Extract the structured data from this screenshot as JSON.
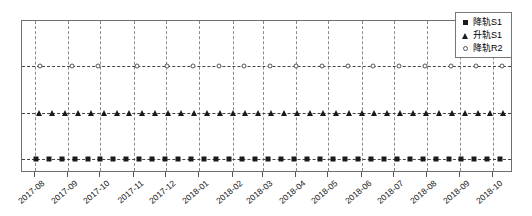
{
  "chart_data": {
    "type": "scatter",
    "title": "",
    "xlabel": "",
    "ylabel": "",
    "grid": true,
    "legend_position": "upper-right",
    "x_tick_labels": [
      "2017-08",
      "2017-09",
      "2017-10",
      "2017-11",
      "2017-12",
      "2018-01",
      "2018-02",
      "2018-03",
      "2018-04",
      "2018-05",
      "2018-06",
      "2018-07",
      "2018-08",
      "2018-09",
      "2018-10"
    ],
    "xlim": [
      "2017-07-20",
      "2018-10-20"
    ],
    "ylim": [
      0,
      3
    ],
    "series": [
      {
        "name": "降轨S1",
        "marker": "square",
        "level": 1,
        "x": [
          "2017-08-02",
          "2017-08-14",
          "2017-08-26",
          "2017-09-07",
          "2017-09-19",
          "2017-10-01",
          "2017-10-13",
          "2017-10-25",
          "2017-11-06",
          "2017-11-18",
          "2017-11-30",
          "2017-12-12",
          "2017-12-24",
          "2018-01-05",
          "2018-01-17",
          "2018-01-29",
          "2018-02-10",
          "2018-02-22",
          "2018-03-06",
          "2018-03-18",
          "2018-03-30",
          "2018-04-11",
          "2018-04-23",
          "2018-05-05",
          "2018-05-17",
          "2018-05-29",
          "2018-06-10",
          "2018-06-22",
          "2018-07-04",
          "2018-07-16",
          "2018-07-28",
          "2018-08-09",
          "2018-08-21",
          "2018-09-02",
          "2018-09-14",
          "2018-09-26",
          "2018-10-08"
        ]
      },
      {
        "name": "升轨S1",
        "marker": "triangle",
        "level": 2,
        "x": [
          "2017-08-05",
          "2017-08-17",
          "2017-08-29",
          "2017-09-10",
          "2017-09-22",
          "2017-10-04",
          "2017-10-16",
          "2017-10-28",
          "2017-11-09",
          "2017-11-21",
          "2017-12-03",
          "2017-12-15",
          "2017-12-27",
          "2018-01-08",
          "2018-01-20",
          "2018-02-01",
          "2018-02-13",
          "2018-02-25",
          "2018-03-09",
          "2018-03-21",
          "2018-04-02",
          "2018-04-14",
          "2018-04-26",
          "2018-05-08",
          "2018-05-20",
          "2018-06-01",
          "2018-06-13",
          "2018-06-25",
          "2018-07-07",
          "2018-07-19",
          "2018-07-31",
          "2018-08-12",
          "2018-08-24",
          "2018-09-05",
          "2018-09-17",
          "2018-09-29",
          "2018-10-11"
        ]
      },
      {
        "name": "降轨R2",
        "marker": "circle",
        "level": 3,
        "x": [
          "2017-08-06",
          "2017-09-05",
          "2017-09-29",
          "2017-11-04",
          "2017-12-02",
          "2017-12-26",
          "2018-01-19",
          "2018-02-12",
          "2018-03-08",
          "2018-04-01",
          "2018-04-25",
          "2018-05-19",
          "2018-06-12",
          "2018-07-06",
          "2018-07-30",
          "2018-08-23",
          "2018-09-16",
          "2018-10-10"
        ]
      }
    ]
  },
  "legend": {
    "items": [
      {
        "label": "降轨S1",
        "marker": "square"
      },
      {
        "label": "升轨S1",
        "marker": "triangle"
      },
      {
        "label": "降轨R2",
        "marker": "circle"
      }
    ]
  }
}
